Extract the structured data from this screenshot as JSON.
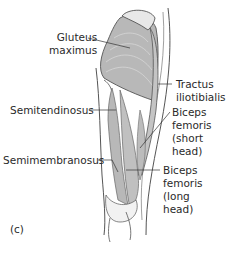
{
  "figure": {
    "panel_label": "(c)",
    "labels": {
      "gluteus_maximus": "Gluteus\nmaximus",
      "tractus_iliotibialis": "Tractus\niliotibialis",
      "semitendinosus": "Semitendinosus",
      "biceps_short": "Biceps\nfemoris\n(short\nhead)",
      "semimembranosus": "Semimembranosus",
      "biceps_long": "Biceps\nfemoris\n(long\nhead)"
    },
    "colors": {
      "muscle": "#b8b8b8",
      "outline": "#555555",
      "leader": "#333333",
      "background": "#ffffff"
    }
  }
}
